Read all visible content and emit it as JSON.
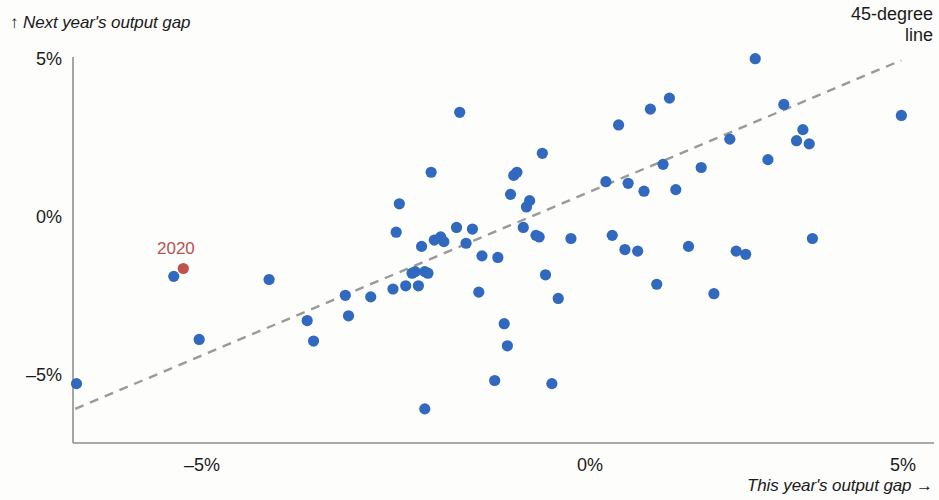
{
  "chart_data": {
    "type": "scatter",
    "title": "",
    "xlabel": "This year's output gap →",
    "ylabel": "↑ Next year's output gap",
    "xlim": [
      -8.15,
      5.5
    ],
    "ylim": [
      -6.1,
      5.9
    ],
    "xticks": [
      -5,
      0,
      5
    ],
    "xticklabels": [
      "–5%",
      "0%",
      "5%"
    ],
    "yticks": [
      5,
      0,
      -5
    ],
    "yticklabels": [
      "5%",
      "0%",
      "–5%"
    ],
    "grid": false,
    "legend_position": "top-right",
    "annotations": [
      {
        "text": "45-degree\nline",
        "target": "reference-line"
      },
      {
        "text": "2020",
        "x": -6.45,
        "y": -1.2,
        "color": "#b5534e"
      }
    ],
    "reference_line": {
      "label": "45-degree line",
      "style": "dashed",
      "color": "#9a9a9a",
      "from": [
        -8.1,
        -6.05
      ],
      "to": [
        4.9,
        5.0
      ]
    },
    "series": [
      {
        "name": "Output gap pairs",
        "color": "#3069bd",
        "marker": "circle",
        "points": [
          [
            -8.08,
            -5.25
          ],
          [
            -6.55,
            -1.85
          ],
          [
            -6.15,
            -3.85
          ],
          [
            -5.05,
            -1.95
          ],
          [
            -4.45,
            -3.25
          ],
          [
            -4.35,
            -3.9
          ],
          [
            -3.85,
            -2.45
          ],
          [
            -3.8,
            -3.1
          ],
          [
            -3.45,
            -2.5
          ],
          [
            -3.1,
            -2.25
          ],
          [
            -3.05,
            -0.45
          ],
          [
            -3.0,
            0.45
          ],
          [
            -2.9,
            -2.15
          ],
          [
            -2.8,
            -1.75
          ],
          [
            -2.75,
            -1.7
          ],
          [
            -2.7,
            -2.15
          ],
          [
            -2.65,
            -0.9
          ],
          [
            -2.6,
            -6.05
          ],
          [
            -2.6,
            -1.7
          ],
          [
            -2.55,
            -1.75
          ],
          [
            -2.5,
            1.45
          ],
          [
            -2.45,
            -0.7
          ],
          [
            -2.35,
            -0.6
          ],
          [
            -2.3,
            -0.75
          ],
          [
            -2.1,
            -0.3
          ],
          [
            -2.05,
            3.35
          ],
          [
            -1.95,
            -0.8
          ],
          [
            -1.85,
            -0.35
          ],
          [
            -1.75,
            -2.35
          ],
          [
            -1.7,
            -1.2
          ],
          [
            -1.5,
            -5.15
          ],
          [
            -1.45,
            -1.25
          ],
          [
            -1.35,
            -3.35
          ],
          [
            -1.3,
            -4.05
          ],
          [
            -1.25,
            0.75
          ],
          [
            -1.2,
            1.35
          ],
          [
            -1.15,
            1.45
          ],
          [
            -1.05,
            -0.3
          ],
          [
            -1.0,
            0.35
          ],
          [
            -0.95,
            0.55
          ],
          [
            -0.85,
            -0.55
          ],
          [
            -0.8,
            -0.6
          ],
          [
            -0.75,
            2.05
          ],
          [
            -0.7,
            -1.8
          ],
          [
            -0.6,
            -5.25
          ],
          [
            -0.5,
            -2.55
          ],
          [
            -0.3,
            -0.65
          ],
          [
            0.25,
            1.15
          ],
          [
            0.35,
            -0.55
          ],
          [
            0.45,
            2.95
          ],
          [
            0.55,
            -1.0
          ],
          [
            0.6,
            1.1
          ],
          [
            0.75,
            -1.05
          ],
          [
            0.85,
            0.85
          ],
          [
            0.95,
            3.45
          ],
          [
            1.05,
            -2.1
          ],
          [
            1.15,
            1.7
          ],
          [
            1.25,
            3.8
          ],
          [
            1.35,
            0.9
          ],
          [
            1.55,
            -0.9
          ],
          [
            1.75,
            1.6
          ],
          [
            1.95,
            -2.4
          ],
          [
            2.2,
            2.5
          ],
          [
            2.3,
            -1.05
          ],
          [
            2.45,
            -1.15
          ],
          [
            2.6,
            5.05
          ],
          [
            2.8,
            1.85
          ],
          [
            3.05,
            3.6
          ],
          [
            3.25,
            2.45
          ],
          [
            3.35,
            2.8
          ],
          [
            3.45,
            2.35
          ],
          [
            3.5,
            -0.65
          ],
          [
            4.9,
            3.25
          ]
        ]
      },
      {
        "name": "2020",
        "color": "#bf534c",
        "marker": "circle",
        "points": [
          [
            -6.4,
            -1.6
          ]
        ]
      }
    ]
  },
  "axes": {
    "y_title": "↑ Next year's output gap",
    "x_title": "This year's output gap →",
    "y_ticks": [
      {
        "label": "5%",
        "value": 5
      },
      {
        "label": "0%",
        "value": 0
      },
      {
        "label": "–5%",
        "value": -5
      }
    ],
    "x_ticks": [
      {
        "label": "–5%",
        "value": -5
      },
      {
        "label": "0%",
        "value": 0
      },
      {
        "label": "5%",
        "value": 5
      }
    ]
  },
  "legend": {
    "reference_line_label_line1": "45-degree",
    "reference_line_label_line2": "line"
  },
  "annotation": {
    "year_label": "2020"
  },
  "colors": {
    "point": "#3069bd",
    "highlight_point": "#bf534c",
    "highlight_text": "#b5534e",
    "axis": "#8f8f8f",
    "reference_line": "#9a9a9a",
    "text": "#1a1a1a",
    "background": "#fdfdfc"
  }
}
